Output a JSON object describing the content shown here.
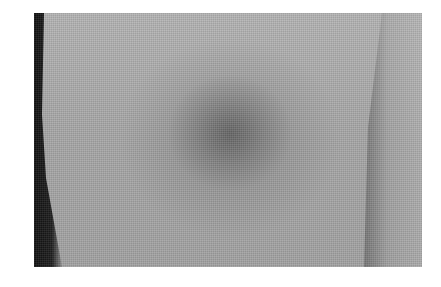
{
  "image": {
    "subject": "bruise on skin",
    "description": "Grayscale photograph of a skin surface with a dark diffuse bruise near the center, a dark shadow along the left edge, and a skin fold on the right side."
  },
  "colors": {
    "background": "#ffffff",
    "skin": "#a9a9a9",
    "bruise": "#5a5a5a",
    "shadow": "#111111"
  }
}
